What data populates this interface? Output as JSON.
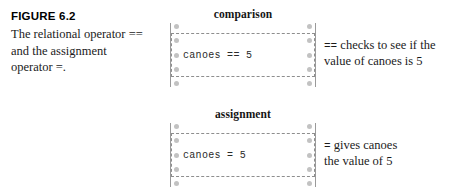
{
  "figure": {
    "label": "FIGURE 6.2",
    "caption_lines": [
      "The relational operator ==",
      "and the assignment",
      "operator =."
    ]
  },
  "diagrams": [
    {
      "heading": "comparison",
      "code": "canoes == 5",
      "dot_count": 5,
      "annotation": {
        "operator": "==",
        "text_line1": " checks to see if the",
        "text_line2": "value of canoes is 5"
      }
    },
    {
      "heading": "assignment",
      "code": "canoes = 5",
      "dot_count": 5,
      "annotation": {
        "operator": "=",
        "text_line1": " gives canoes",
        "text_line2": "the value of 5"
      }
    }
  ],
  "colors": {
    "background": "#ffffff",
    "text": "#1b1b1b",
    "rail": "#9a9a9a",
    "dot": "#c2c2c2",
    "dashed_border": "#8e8e8e"
  }
}
